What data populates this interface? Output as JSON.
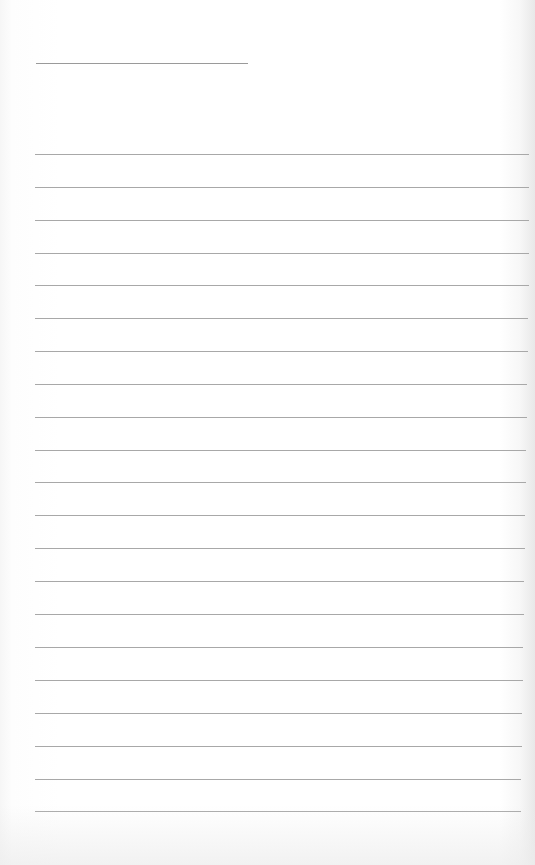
{
  "paper": {
    "type": "lined notebook page",
    "background_color": "#ffffff",
    "line_color": "#a8a8a8",
    "header_line": {
      "x": 36,
      "y": 63,
      "width": 212
    },
    "rules": [
      {
        "y": 154,
        "width": 494
      },
      {
        "y": 187,
        "width": 494
      },
      {
        "y": 220,
        "width": 494
      },
      {
        "y": 253,
        "width": 494
      },
      {
        "y": 285,
        "width": 494
      },
      {
        "y": 318,
        "width": 493
      },
      {
        "y": 351,
        "width": 493
      },
      {
        "y": 384,
        "width": 492
      },
      {
        "y": 417,
        "width": 492
      },
      {
        "y": 450,
        "width": 491
      },
      {
        "y": 482,
        "width": 491
      },
      {
        "y": 515,
        "width": 490
      },
      {
        "y": 548,
        "width": 490
      },
      {
        "y": 581,
        "width": 489
      },
      {
        "y": 614,
        "width": 489
      },
      {
        "y": 647,
        "width": 488
      },
      {
        "y": 680,
        "width": 488
      },
      {
        "y": 713,
        "width": 487
      },
      {
        "y": 746,
        "width": 487
      },
      {
        "y": 779,
        "width": 486
      },
      {
        "y": 811,
        "width": 486
      }
    ]
  }
}
